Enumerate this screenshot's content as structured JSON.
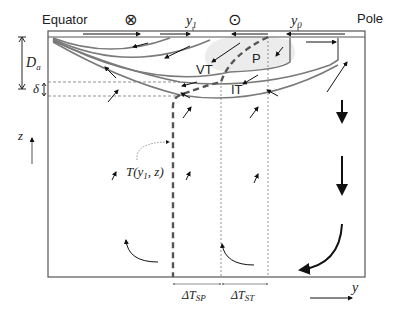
{
  "diagram": {
    "title_left": "Equator",
    "title_right": "Pole",
    "symbol_into_page": "⊗",
    "symbol_out_of_page": "⊙",
    "y1_label": "y",
    "y1_sub": "1",
    "y0_label": "y",
    "y0_sub": "0",
    "Da_label": "D",
    "Da_sub": "a",
    "delta_label": "δ",
    "z_label": "z",
    "y_axis_label": "y",
    "temperature_label": "T(y",
    "temperature_sub": "1",
    "temperature_tail": ", z)",
    "region_VT": "VT",
    "region_P": "P",
    "region_IT": "IT",
    "dT_SP_prefix": "ΔT",
    "dT_SP_sub": "SP",
    "dT_ST_prefix": "ΔT",
    "dT_ST_sub": "ST",
    "colors": {
      "line_gray": "#7a7a7a",
      "box": "#555555",
      "arrow": "#111111",
      "shade": "#ececec"
    }
  }
}
